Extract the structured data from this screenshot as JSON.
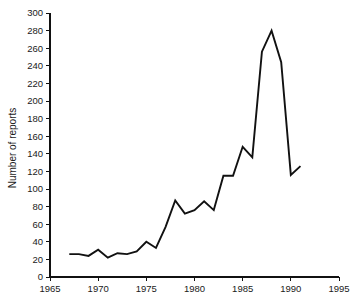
{
  "chart_data": {
    "type": "line",
    "title": "",
    "xlabel": "",
    "ylabel": "Number of reports",
    "xlim": [
      1965,
      1995
    ],
    "ylim": [
      0,
      300
    ],
    "grid": false,
    "legend": null,
    "xticks": [
      1965,
      1970,
      1975,
      1980,
      1985,
      1990,
      1995
    ],
    "xtick_labels": [
      "1965",
      "1970",
      "1975",
      "1980",
      "1985",
      "1990",
      "1995"
    ],
    "yticks": [
      0,
      20,
      40,
      60,
      80,
      100,
      120,
      140,
      160,
      180,
      200,
      220,
      240,
      260,
      280,
      300
    ],
    "ytick_labels": [
      "0",
      "20",
      "40",
      "60",
      "80",
      "100",
      "120",
      "140",
      "160",
      "180",
      "200",
      "220",
      "240",
      "260",
      "280",
      "300"
    ],
    "x": [
      1967,
      1968,
      1969,
      1970,
      1971,
      1972,
      1973,
      1974,
      1975,
      1976,
      1977,
      1978,
      1979,
      1980,
      1981,
      1982,
      1983,
      1984,
      1985,
      1986,
      1987,
      1988,
      1989,
      1990,
      1991
    ],
    "values": [
      26,
      26,
      24,
      31,
      22,
      27,
      26,
      29,
      40,
      33,
      57,
      87,
      72,
      76,
      86,
      76,
      115,
      115,
      148,
      136,
      256,
      280,
      244,
      116,
      126
    ],
    "series": [
      {
        "name": "Number of reports",
        "color": "#111111",
        "x": [
          1967,
          1968,
          1969,
          1970,
          1971,
          1972,
          1973,
          1974,
          1975,
          1976,
          1977,
          1978,
          1979,
          1980,
          1981,
          1982,
          1983,
          1984,
          1985,
          1986,
          1987,
          1988,
          1989,
          1990,
          1991
        ],
        "values": [
          26,
          26,
          24,
          31,
          22,
          27,
          26,
          29,
          40,
          33,
          57,
          87,
          72,
          76,
          86,
          76,
          115,
          115,
          148,
          136,
          256,
          280,
          244,
          116,
          126
        ]
      }
    ]
  },
  "axes": {
    "y_axis_title": "Number of reports"
  }
}
